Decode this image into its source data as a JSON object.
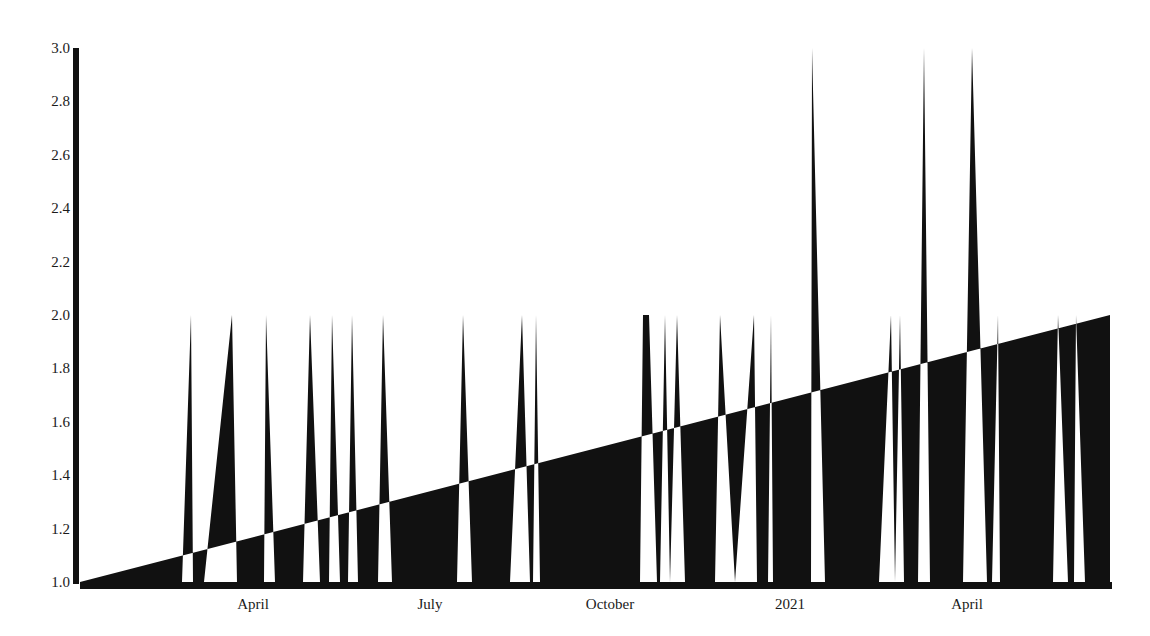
{
  "chart_data": {
    "type": "area",
    "title": "",
    "xlabel": "",
    "ylabel": "",
    "ylim": [
      1.0,
      3.0
    ],
    "grid": false,
    "legend": null,
    "fill_rule": "evenodd",
    "colors": {
      "fill": "#111111",
      "background": "#ffffff",
      "axis": "#111111",
      "text": "#1a1a1a"
    },
    "y_ticks": [
      "1.0",
      "1.2",
      "1.4",
      "1.6",
      "1.8",
      "2.0",
      "2.2",
      "2.4",
      "2.6",
      "2.8",
      "3.0"
    ],
    "x_ticks": [
      {
        "label": "April",
        "px": 253
      },
      {
        "label": "July",
        "px": 430
      },
      {
        "label": "October",
        "px": 610
      },
      {
        "label": "2021",
        "px": 790
      },
      {
        "label": "April",
        "px": 967
      }
    ],
    "trend_line": {
      "start": {
        "px": 80,
        "value": 1.0
      },
      "end": {
        "px": 1110,
        "value": 2.0
      }
    },
    "series": [
      {
        "name": "events",
        "description": "baseline 1.0 with spikes to 2.0 or 3.0",
        "points": [
          [
            80,
            1
          ],
          [
            182,
            1
          ],
          [
            191,
            2
          ],
          [
            193,
            1
          ],
          [
            204,
            1
          ],
          [
            232,
            2
          ],
          [
            237,
            1
          ],
          [
            264,
            1
          ],
          [
            266,
            2
          ],
          [
            275,
            1
          ],
          [
            303,
            1
          ],
          [
            310,
            2
          ],
          [
            320,
            1
          ],
          [
            329,
            1
          ],
          [
            332,
            2
          ],
          [
            340,
            1
          ],
          [
            348,
            1
          ],
          [
            352,
            2
          ],
          [
            358,
            1
          ],
          [
            378,
            1
          ],
          [
            383,
            2
          ],
          [
            392,
            1
          ],
          [
            457,
            1
          ],
          [
            463,
            2
          ],
          [
            472,
            1
          ],
          [
            510,
            1
          ],
          [
            522,
            2
          ],
          [
            530,
            1
          ],
          [
            533,
            1
          ],
          [
            536,
            2
          ],
          [
            540,
            1
          ],
          [
            640,
            1
          ],
          [
            643,
            2
          ],
          [
            649,
            2
          ],
          [
            657,
            1
          ],
          [
            660,
            1
          ],
          [
            665,
            2
          ],
          [
            670,
            1
          ],
          [
            677,
            2
          ],
          [
            685,
            1
          ],
          [
            715,
            1
          ],
          [
            720,
            2
          ],
          [
            735,
            1
          ],
          [
            754,
            2
          ],
          [
            757,
            1
          ],
          [
            768,
            1
          ],
          [
            771,
            2
          ],
          [
            773,
            1
          ],
          [
            811,
            1
          ],
          [
            812,
            3
          ],
          [
            825,
            1
          ],
          [
            879,
            1
          ],
          [
            891,
            2
          ],
          [
            895,
            1
          ],
          [
            900,
            2
          ],
          [
            904,
            1
          ],
          [
            918,
            1
          ],
          [
            924,
            3
          ],
          [
            930,
            1
          ],
          [
            963,
            1
          ],
          [
            972,
            3
          ],
          [
            987,
            1
          ],
          [
            992,
            1
          ],
          [
            998,
            2
          ],
          [
            1000,
            1
          ],
          [
            1053,
            1
          ],
          [
            1058,
            2
          ],
          [
            1068,
            1
          ],
          [
            1074,
            1
          ],
          [
            1076,
            2
          ],
          [
            1085,
            1
          ],
          [
            1110,
            1
          ]
        ]
      }
    ]
  }
}
